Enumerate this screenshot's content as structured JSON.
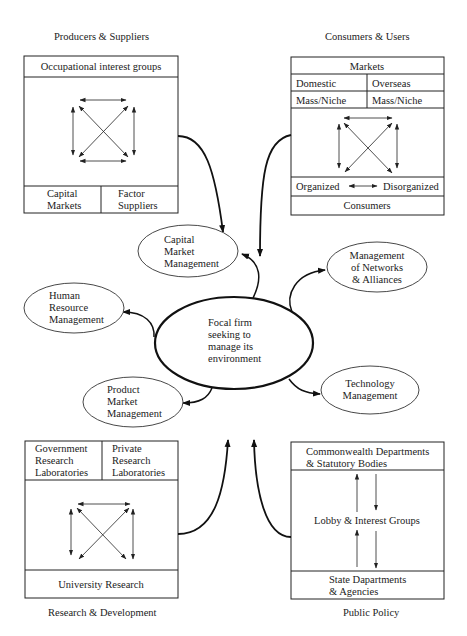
{
  "quadrants": {
    "producers": {
      "caption": "Producers & Suppliers",
      "header": "Occupational interest groups",
      "bottom_left": [
        "Capital",
        "Markets"
      ],
      "bottom_right": [
        "Factor",
        "Suppliers"
      ]
    },
    "consumers": {
      "caption": "Consumers & Users",
      "markets": "Markets",
      "domestic": "Domestic",
      "overseas": "Overseas",
      "mass_niche_left": "Mass/Niche",
      "mass_niche_right": "Mass/Niche",
      "organized": "Organized",
      "disorganized": "Disorganized",
      "footer": "Consumers"
    },
    "research": {
      "caption": "Research & Development",
      "top_left": [
        "Government",
        "Research",
        "Laboratories"
      ],
      "top_right": [
        "Private",
        "Research",
        "Laboratories"
      ],
      "footer": "University Research"
    },
    "policy": {
      "caption": "Public Policy",
      "header": [
        "Commonwealth Departments",
        "& Statutory Bodies"
      ],
      "middle": "Lobby & Interest Groups",
      "footer": [
        "State Dapartments",
        "& Agencies"
      ]
    }
  },
  "focal": [
    "Focal firm",
    "seeking to",
    "manage its",
    "environment"
  ],
  "functions": {
    "capital": [
      "Capital",
      "Market",
      "Management"
    ],
    "networks": [
      "Management",
      "of Networks",
      "& Alliances"
    ],
    "human": [
      "Human",
      "Resource",
      "Management"
    ],
    "product": [
      "Product",
      "Market",
      "Management"
    ],
    "technology": [
      "Technology",
      "Management"
    ]
  }
}
